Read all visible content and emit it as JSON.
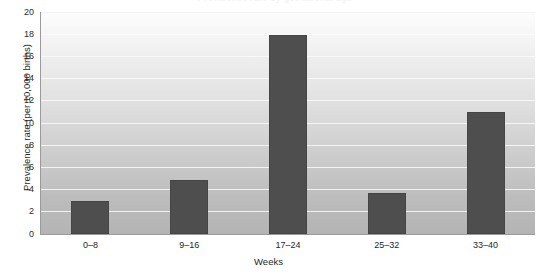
{
  "chart_data": {
    "type": "bar",
    "title": "",
    "clipped_title_fragment": "Prevalence rate by gestational age",
    "categories": [
      "0–8",
      "9–16",
      "17–24",
      "25–32",
      "33–40"
    ],
    "values": [
      3.0,
      4.9,
      17.9,
      3.7,
      11.0
    ],
    "series": [
      {
        "name": "Prevalence rate",
        "values": [
          3.0,
          4.9,
          17.9,
          3.7,
          11.0
        ]
      }
    ],
    "xlabel": "Weeks",
    "ylabel": "Prevalence rate (per 10,000 births)",
    "ylim": [
      0,
      20
    ],
    "ytick_values": [
      0,
      2,
      4,
      6,
      8,
      10,
      12,
      14,
      16,
      18,
      20
    ],
    "ytick_labels": [
      "0",
      "2",
      "4",
      "6",
      "8",
      "10",
      "12",
      "14",
      "16",
      "18",
      "20"
    ],
    "grid": true,
    "grid_orientation": "horizontal",
    "legend": false,
    "legend_position": "none",
    "bar_color": "#4e4e4e",
    "plot_background_top_color": "#fdfdfd",
    "plot_background_bottom_color": "#b4b4b4",
    "gridline_color": "#fafafa",
    "axis_line_color": "#9a9a9a",
    "text_color": "#1f1f1f"
  },
  "axis": {
    "x_title": "Weeks",
    "y_title": "Prevalence rate (per 10,000 births)"
  }
}
